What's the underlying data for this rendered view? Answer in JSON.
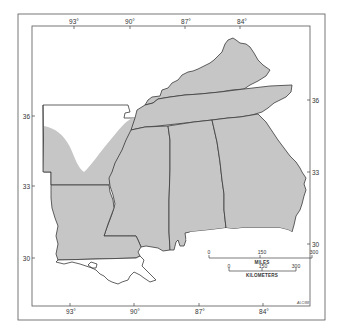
{
  "map": {
    "type": "regional-outline-map",
    "region": "Southeastern United States",
    "states_shaded": [
      "Kentucky",
      "Tennessee",
      "Mississippi",
      "Alabama",
      "Georgia",
      "Louisiana"
    ],
    "states_partially_shaded": [
      "Arkansas"
    ],
    "shade_color": "#c6c6c6",
    "outline_color": "#3a3a3a",
    "longitude_ticks": {
      "top": [
        "93°",
        "90°",
        "87°",
        "84°"
      ],
      "bottom": [
        "93°",
        "90°",
        "87°",
        "84°"
      ]
    },
    "latitude_ticks": {
      "left": [
        "36",
        "33",
        "30"
      ],
      "right": [
        "36",
        "33",
        "30"
      ]
    },
    "scale_bar": {
      "miles": {
        "ticks": [
          "0",
          "150",
          "300"
        ],
        "label": "MILES"
      },
      "kilometers": {
        "ticks": [
          "0",
          "150",
          "300"
        ],
        "label": "KILOMETERS"
      }
    },
    "credit": "ALC/88"
  }
}
